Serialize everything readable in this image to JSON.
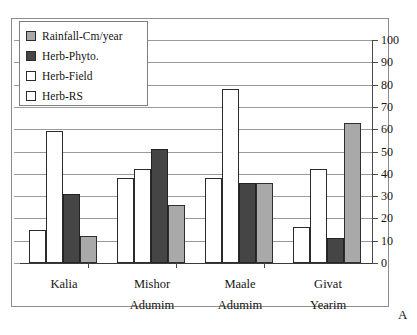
{
  "chart_data": {
    "type": "bar",
    "title": "",
    "xlabel": "",
    "ylabel": "",
    "ylim": [
      0,
      100
    ],
    "ytick_step": 10,
    "yticks": [
      100,
      90,
      80,
      70,
      60,
      50,
      40,
      30,
      20,
      10,
      0
    ],
    "grid": true,
    "legend_position": "top-left",
    "categories": [
      "Kalia",
      "Mishor Adumim",
      "Maale Adumim",
      "Givat Yearim"
    ],
    "category_lines": [
      [
        "Kalia",
        ""
      ],
      [
        "Mishor",
        "Adumim"
      ],
      [
        "Maale",
        "Adumim"
      ],
      [
        "Givat",
        "Yearim"
      ]
    ],
    "series": [
      {
        "name": "Herb-RS",
        "color": "#ffffff",
        "values": [
          15,
          38,
          38,
          16
        ]
      },
      {
        "name": "Herb-Field",
        "color": "#ffffff",
        "values": [
          59,
          42,
          78,
          42
        ]
      },
      {
        "name": "Herb-Phyto.",
        "color": "#454545",
        "values": [
          31,
          51,
          36,
          11
        ]
      },
      {
        "name": "Rainfall-Cm/year",
        "color": "#a9a9a9",
        "values": [
          12,
          26,
          36,
          63
        ]
      }
    ],
    "series_draw_order": [
      "Herb-RS",
      "Herb-Field",
      "Herb-Phyto.",
      "Rainfall-Cm/year"
    ],
    "annotation": "A"
  },
  "legend": {
    "items": [
      {
        "label": "Rainfall-Cm/year",
        "swatch": "s-rain"
      },
      {
        "label": "Herb-Phyto.",
        "swatch": "s-phyto"
      },
      {
        "label": "Herb-Field",
        "swatch": "s-field"
      },
      {
        "label": "Herb-RS",
        "swatch": "s-rs"
      }
    ]
  },
  "panel": {
    "letter": "A"
  },
  "colors": {
    "rainfall": "#a9a9a9",
    "herb_phyto": "#454545",
    "herb_field": "#ffffff",
    "herb_rs": "#ffffff",
    "grid": "#9a9a9a",
    "axis": "#4a4a4a",
    "frame": "#8d8d8d"
  }
}
